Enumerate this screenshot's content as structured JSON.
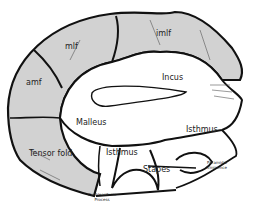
{
  "diagram": {
    "title": "",
    "colors": {
      "fold_fill": "#d2d2d2",
      "outline": "#111111",
      "background": "#ffffff"
    },
    "labels": {
      "imlf": "imlf",
      "mlf": "mlf",
      "amf": "amf",
      "incus": "Incus",
      "malleus": "Malleus",
      "tensor_fold": "Tensor fold",
      "isthmus_left": "Isthmus",
      "isthmus_right": "Isthmus",
      "stapes": "Stapes",
      "cochleariform_process_line1": "Cochleariform",
      "cochleariform_process_line2": "Process",
      "pyramidal_eminence_line1": "Pyramidal",
      "pyramidal_eminence_line2": "Eminence"
    }
  }
}
